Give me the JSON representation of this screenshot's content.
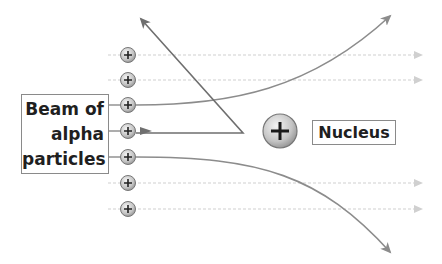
{
  "diagram": {
    "beam_label_lines": [
      "Beam of",
      "alpha",
      "particles"
    ],
    "nucleus_label": "Nucleus",
    "colors": {
      "deflected_path": "#8c8c8c",
      "reflected_path": "#777777",
      "undeflected_path": "#d0d0d0",
      "particle_fill": "#c8c8c8",
      "nucleus_fill": "#c4c4c4",
      "text": "#1f1f1f",
      "box_border": "#8a8a8a"
    },
    "particles": [
      {
        "x": 128,
        "y": 55,
        "path": "straight"
      },
      {
        "x": 128,
        "y": 80,
        "path": "straight"
      },
      {
        "x": 128,
        "y": 105,
        "path": "deflected-up"
      },
      {
        "x": 128,
        "y": 131,
        "path": "reflected-back"
      },
      {
        "x": 128,
        "y": 157,
        "path": "deflected-down"
      },
      {
        "x": 128,
        "y": 183,
        "path": "straight"
      },
      {
        "x": 128,
        "y": 209,
        "path": "straight"
      }
    ],
    "nucleus": {
      "x": 280,
      "y": 131,
      "r": 17,
      "symbol": "+"
    },
    "particle_symbol": "+"
  }
}
